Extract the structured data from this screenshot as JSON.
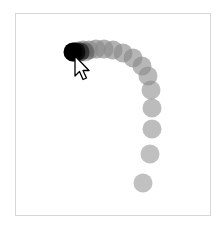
{
  "scene": {
    "description": "mouse drag trail",
    "frame": {
      "x": 15,
      "y": 13,
      "width": 196,
      "height": 203,
      "border_color": "#d6d6d6"
    },
    "trail": {
      "dot_radius": 9.5,
      "dot_color": "#8a8a8a",
      "dot_opacity": 0.62,
      "head_color": "#000000",
      "points": [
        [
          143,
          183
        ],
        [
          150,
          154
        ],
        [
          152,
          129
        ],
        [
          152,
          108
        ],
        [
          151,
          90
        ],
        [
          148,
          76
        ],
        [
          142,
          66
        ],
        [
          133,
          58
        ],
        [
          123,
          53
        ],
        [
          113,
          50
        ],
        [
          104,
          49
        ],
        [
          96,
          49
        ],
        [
          89,
          50
        ],
        [
          83,
          50
        ],
        [
          78,
          51
        ],
        [
          74,
          52
        ]
      ],
      "head_points": [
        [
          73,
          52
        ],
        [
          76,
          52
        ],
        [
          80,
          52
        ],
        [
          85,
          52
        ]
      ]
    },
    "cursor": {
      "type": "arrow-pointer",
      "tip": [
        75,
        56
      ],
      "fill": "#ffffff",
      "stroke": "#000000"
    }
  }
}
